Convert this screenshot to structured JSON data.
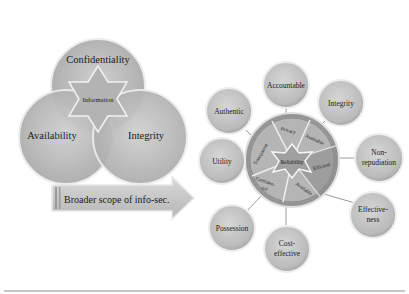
{
  "venn": {
    "circles": [
      {
        "label": "Confidentiality"
      },
      {
        "label": "Availability"
      },
      {
        "label": "Integrity"
      }
    ],
    "center_label": "Information"
  },
  "arrow": {
    "label": "Broader scope of info-sec."
  },
  "wheel": {
    "center_label": "Reliability",
    "segments": [
      {
        "label": "Privacy"
      },
      {
        "label": "Auditable"
      },
      {
        "label": "Efficient"
      },
      {
        "label": "Available"
      },
      {
        "label": "Confiden-"
      },
      {
        "label": "tial"
      },
      {
        "label": "Transparent"
      }
    ]
  },
  "satellites": [
    {
      "label": "Accountable"
    },
    {
      "label": "Integrity"
    },
    {
      "label": "Authentic"
    },
    {
      "label": "Non-"
    },
    {
      "label": "repudiation"
    },
    {
      "label": "Utility"
    },
    {
      "label": "Effective-"
    },
    {
      "label": "ness"
    },
    {
      "label": "Possession"
    },
    {
      "label": "Cost-"
    },
    {
      "label": "effective"
    }
  ],
  "colors": {
    "circle_fill": "#bdbdbd",
    "circle_stroke": "#e6e6e6",
    "wheel_fill": "#a8a8a8",
    "line": "#8c8c8c"
  }
}
